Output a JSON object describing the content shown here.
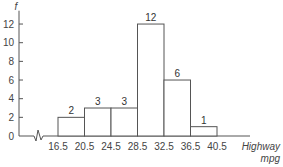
{
  "chart_data": {
    "type": "bar",
    "subtype": "histogram",
    "title": "",
    "xlabel": "Highway mpg",
    "xlabel_lines": [
      "Highway",
      "mpg"
    ],
    "ylabel": "f",
    "bin_edges": [
      16.5,
      20.5,
      24.5,
      28.5,
      32.5,
      36.5,
      40.5
    ],
    "bin_edge_labels": [
      "16.5",
      "20.5",
      "24.5",
      "28.5",
      "32.5",
      "36.5",
      "40.5"
    ],
    "categories": [
      "16.5-20.5",
      "20.5-24.5",
      "24.5-28.5",
      "28.5-32.5",
      "32.5-36.5",
      "36.5-40.5"
    ],
    "values": [
      2,
      3,
      3,
      12,
      6,
      1
    ],
    "value_labels": [
      "2",
      "3",
      "3",
      "12",
      "6",
      "1"
    ],
    "y_ticks": [
      0,
      2,
      4,
      6,
      8,
      10,
      12
    ],
    "y_tick_labels": [
      "0",
      "2",
      "4",
      "6",
      "8",
      "10",
      "12"
    ],
    "ylim": [
      0,
      13
    ],
    "x_axis_break": true,
    "grid": false,
    "legend": null,
    "colors": {
      "axis": "#555555",
      "bar_stroke": "#555555",
      "bar_fill": "#ffffff"
    }
  }
}
